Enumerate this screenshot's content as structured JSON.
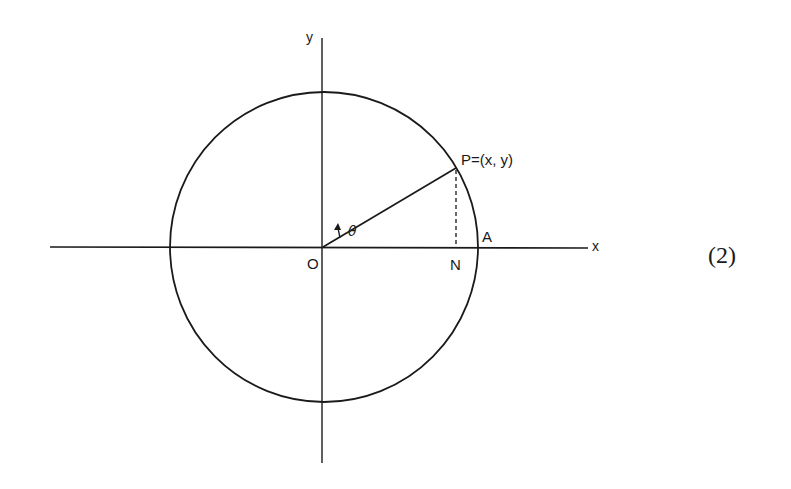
{
  "diagram": {
    "type": "unit-circle-with-angle",
    "labels": {
      "y_axis": "y",
      "x_axis": "x",
      "origin": "O",
      "point": "P=(x, y)",
      "foot": "N",
      "intercept": "A",
      "angle": "θ"
    },
    "equation_number": "(2)",
    "colors": {
      "stroke": "#1a1a1a",
      "background": "#ffffff"
    },
    "geometry": {
      "center": [
        323,
        247
      ],
      "radius": 155,
      "point_P": [
        456,
        168
      ],
      "point_N": [
        456,
        247
      ],
      "point_A": [
        478,
        247
      ],
      "x_axis_range": [
        50,
        588
      ],
      "y_axis_range": [
        38,
        463
      ]
    }
  }
}
